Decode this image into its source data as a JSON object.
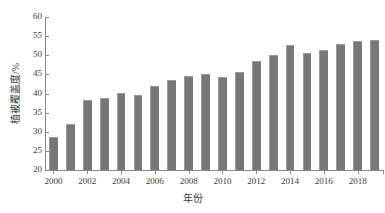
{
  "chart_data": {
    "type": "bar",
    "title": "",
    "xlabel": "年份",
    "ylabel": "植被覆盖度/%",
    "categories": [
      2000,
      2001,
      2002,
      2003,
      2004,
      2005,
      2006,
      2007,
      2008,
      2009,
      2010,
      2011,
      2012,
      2013,
      2014,
      2015,
      2016,
      2017,
      2018,
      2019
    ],
    "values": [
      28.6,
      31.9,
      38.2,
      38.7,
      40.1,
      39.6,
      41.9,
      43.6,
      44.6,
      45.1,
      44.3,
      45.7,
      48.6,
      50.2,
      52.6,
      50.7,
      51.3,
      52.9,
      53.7,
      54.1
    ],
    "series": [
      {
        "name": "植被覆盖度",
        "values": [
          28.6,
          31.9,
          38.2,
          38.7,
          40.1,
          39.6,
          41.9,
          43.6,
          44.6,
          45.1,
          44.3,
          45.7,
          48.6,
          50.2,
          52.6,
          50.7,
          51.3,
          52.9,
          53.7,
          54.1
        ]
      }
    ],
    "ylim": [
      20,
      60
    ],
    "ytick_labels": [
      "20",
      "25",
      "30",
      "35",
      "40",
      "45",
      "50",
      "55",
      "60"
    ],
    "ytick_values": [
      20,
      25,
      30,
      35,
      40,
      45,
      50,
      55,
      60
    ],
    "xtick_labels": [
      "2000",
      "2002",
      "2004",
      "2006",
      "2008",
      "2010",
      "2012",
      "2014",
      "2016",
      "2018"
    ],
    "xtick_values": [
      2000,
      2002,
      2004,
      2006,
      2008,
      2010,
      2012,
      2014,
      2016,
      2018
    ],
    "grid": false,
    "legend": false,
    "legend_position": "none",
    "bar_color": "#777777",
    "axis_color": "#888888",
    "text_color": "#3a3a3a"
  }
}
